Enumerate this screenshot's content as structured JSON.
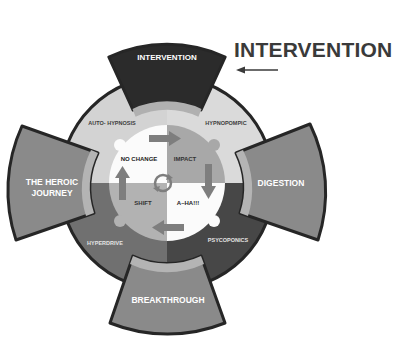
{
  "side_label": {
    "text": "INTERVENTION",
    "arrow": "left-arrow-icon"
  },
  "flaps": {
    "top": "INTERVENTION",
    "left_line1": "THE HEROIC",
    "left_line2": "JOURNEY",
    "right": "DIGESTION",
    "bottom": "BREAKTHROUGH"
  },
  "ring_segments": {
    "top_left": "AUTO- HYPNOSIS",
    "top_right": "HYPNOPOMPIC",
    "bottom_left": "HYPERDRIVE",
    "bottom_right": "PSYCOPONICS"
  },
  "inner_quadrants": {
    "top_left": "NO CHANGE",
    "top_right": "IMPACT",
    "bottom_left": "SHIFT",
    "bottom_right": "A–HA!!!"
  },
  "inner_arrows": [
    {
      "position": "top",
      "direction": "right"
    },
    {
      "position": "right",
      "direction": "down"
    },
    {
      "position": "bottom",
      "direction": "left"
    },
    {
      "position": "left",
      "direction": "up"
    }
  ],
  "center_icon": "cycle-icon",
  "colors": {
    "flap_top": "#2b2b2b",
    "flap_side": "#8c8c8c",
    "flap_band": "#b4b4b4",
    "ring_top": "#d6d6d6",
    "ring_bottom_left": "#6f6f6f",
    "ring_bottom_right": "#4a4a4a",
    "quad_light": "#fafafa",
    "quad_mid": "#a9a9a9",
    "arrow": "#7e7e7e",
    "outline": "#262626"
  }
}
